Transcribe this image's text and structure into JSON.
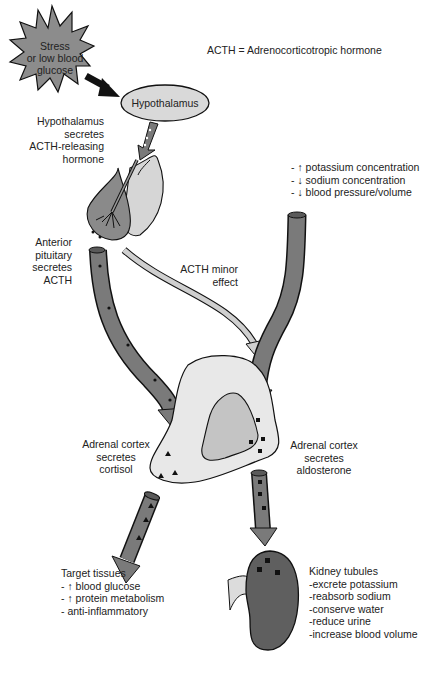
{
  "legend": {
    "definition": "ACTH = Adrenocorticotropic hormone"
  },
  "stimulus": {
    "lines": [
      "Stress",
      "or low blood",
      "glucose"
    ]
  },
  "hypothalamus": {
    "label": "Hypothalamus"
  },
  "hypothalamus_secretes": {
    "lines": [
      "Hypothalamus",
      "secretes",
      "ACTH-releasing",
      "hormone"
    ]
  },
  "anterior_pituitary": {
    "lines": [
      "Anterior",
      "pituitary",
      "secretes",
      "ACTH"
    ]
  },
  "aldosterone_triggers": {
    "lines": [
      "- ↑ potassium concentration",
      "- ↓ sodium concentration",
      "- ↓ blood pressure/volume"
    ]
  },
  "acth_minor": {
    "lines": [
      "ACTH minor",
      "effect"
    ]
  },
  "adrenal_cortisol": {
    "lines": [
      "Adrenal cortex",
      "secretes",
      "cortisol"
    ]
  },
  "adrenal_aldosterone": {
    "lines": [
      "Adrenal cortex",
      "secretes",
      "aldosterone"
    ]
  },
  "target_tissues": {
    "lines": [
      "Target tissues",
      "- ↑ blood glucose",
      "- ↑ protein metabolism",
      "- anti-inflammatory"
    ]
  },
  "kidney_tubules": {
    "lines": [
      "Kidney tubules",
      "-excrete potassium",
      "-reabsorb sodium",
      "-conserve water",
      "-reduce urine",
      "-increase blood volume"
    ]
  },
  "colors": {
    "arrow_fill": "#7a7a7a",
    "light_fill": "#e6e6e6",
    "mid_fill": "#bdbdbd",
    "kidney_fill": "#5f5f5f",
    "stroke": "#111111"
  }
}
